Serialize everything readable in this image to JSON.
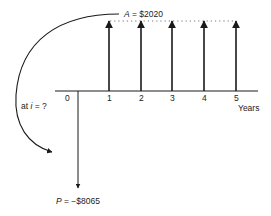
{
  "diagram": {
    "type": "cash-flow-diagram",
    "annuity_label_var": "A",
    "annuity_label_value": " = $2020",
    "present_label_var": "P",
    "present_label_value": " = −$8065",
    "rate_label_prefix": "at ",
    "rate_label_var": "i",
    "rate_label_suffix": " = ?",
    "axis_unit": "Years",
    "periods": [
      "0",
      "1",
      "2",
      "3",
      "4",
      "5"
    ],
    "cash_flows": [
      {
        "year": 0,
        "amount": -8065,
        "direction": "down"
      },
      {
        "year": 1,
        "amount": 2020,
        "direction": "up"
      },
      {
        "year": 2,
        "amount": 2020,
        "direction": "up"
      },
      {
        "year": 3,
        "amount": 2020,
        "direction": "up"
      },
      {
        "year": 4,
        "amount": 2020,
        "direction": "up"
      },
      {
        "year": 5,
        "amount": 2020,
        "direction": "up"
      }
    ],
    "line_color": "#1a1a1a"
  }
}
